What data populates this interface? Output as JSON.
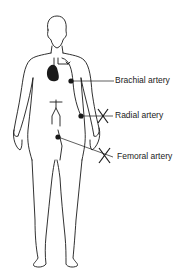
{
  "diagram": {
    "type": "anatomical-figure",
    "labels": [
      {
        "id": "brachial",
        "text": "Brachial artery",
        "marked_x": false
      },
      {
        "id": "radial",
        "text": "Radial artery",
        "marked_x": true
      },
      {
        "id": "femoral",
        "text": "Femoral artery",
        "marked_x": true
      }
    ],
    "colors": {
      "line": "#1a1a1a",
      "background": "#ffffff"
    }
  }
}
